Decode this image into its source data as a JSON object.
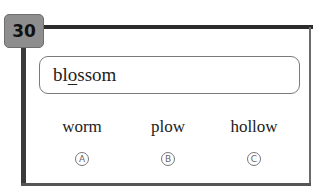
{
  "question": {
    "number": "30",
    "word": {
      "before": "bl",
      "underlined": "o",
      "after": "ssom"
    },
    "options": [
      {
        "letter": "A",
        "text": "worm"
      },
      {
        "letter": "B",
        "text": "plow"
      },
      {
        "letter": "C",
        "text": "hollow"
      }
    ]
  }
}
